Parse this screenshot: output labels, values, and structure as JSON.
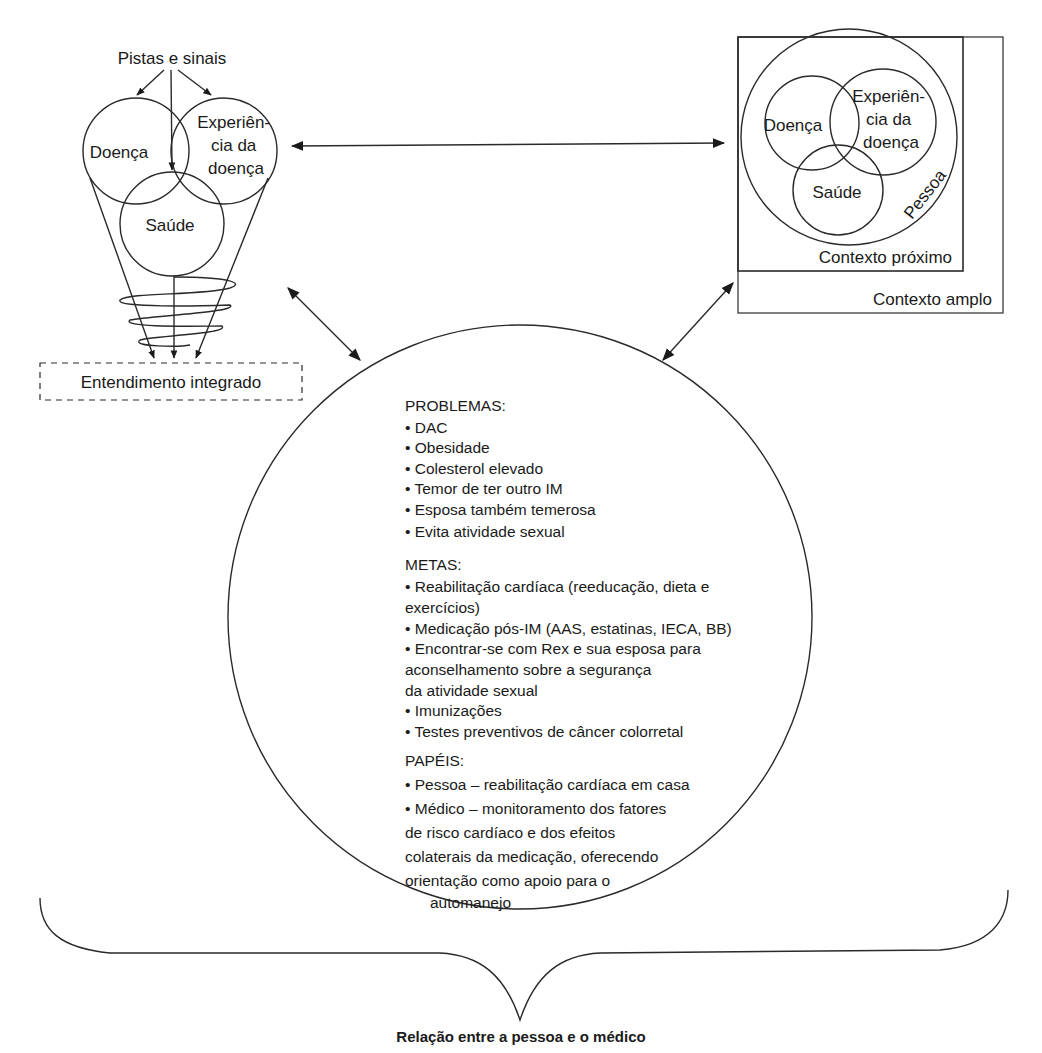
{
  "left_model": {
    "cues_label": "Pistas e sinais",
    "circle_disease": "Doença",
    "circle_illness_lines": [
      "Experiên-",
      "cia da",
      "doença"
    ],
    "circle_health": "Saúde",
    "integrated_label": "Entendimento integrado"
  },
  "right_model": {
    "circle_disease": "Doença",
    "circle_illness_lines": [
      "Experiên-",
      "cia da",
      "doença"
    ],
    "circle_health": "Saúde",
    "person_label": "Pessoa",
    "proximal_context": "Contexto próximo",
    "distal_context": "Contexto amplo"
  },
  "common_ground": {
    "problems_header": "PROBLEMAS:",
    "problems": [
      "• DAC",
      "• Obesidade",
      "• Colesterol elevado",
      "• Temor de ter outro IM",
      "• Esposa também temerosa",
      "• Evita atividade sexual"
    ],
    "goals_header": "METAS:",
    "goals_lines": [
      "• Reabilitação cardíaca (reeducação, dieta e",
      "exercícios)",
      "• Medicação pós-IM (AAS, estatinas, IECA, BB)",
      "• Encontrar-se com Rex e sua esposa para",
      "aconselhamento sobre a segurança",
      "da atividade sexual",
      "• Imunizações",
      "• Testes preventivos de câncer colorretal"
    ],
    "roles_header": "PAPÉIS:",
    "roles_lines": [
      "• Pessoa – reabilitação cardíaca em casa",
      "• Médico – monitoramento dos fatores",
      "de risco cardíaco e dos efeitos",
      "colaterais da medicação, oferecendo",
      "orientação como apoio para o",
      "automanejo"
    ]
  },
  "caption": "Relação entre a pessoa e o médico",
  "colors": {
    "line": "#2a2a2a",
    "text": "#1a1a1a",
    "background": "#ffffff"
  }
}
